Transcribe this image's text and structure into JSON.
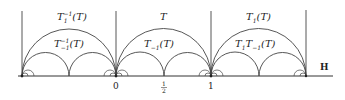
{
  "diagram": {
    "type": "hyperbolic-upper-half-plane-tessellation",
    "plane_label": "H",
    "axis_ticks": [
      {
        "label": "0",
        "x": 116
      },
      {
        "label": "1/2",
        "num": "1",
        "den": "2",
        "x": 164
      },
      {
        "label": "1",
        "x": 211
      }
    ],
    "regions": [
      {
        "top": {
          "base": "T",
          "sub": "1",
          "sup": "−1",
          "arg": "(T)"
        },
        "bottom": {
          "base": "T",
          "sub": "−1",
          "sup": "−1",
          "arg": "(T)"
        }
      },
      {
        "top": {
          "base": "T"
        },
        "bottom": {
          "base": "T",
          "sub": "−1",
          "arg": "(T)"
        }
      },
      {
        "top": {
          "base": "T",
          "sub": "1",
          "arg": "(T)"
        },
        "bottom": {
          "base": "T",
          "sub": "1",
          "base2": "T",
          "sub2": "−1",
          "arg": "(T)"
        }
      }
    ],
    "colors": {
      "stroke": "#333333",
      "text": "#222222",
      "background": "#ffffff"
    }
  }
}
